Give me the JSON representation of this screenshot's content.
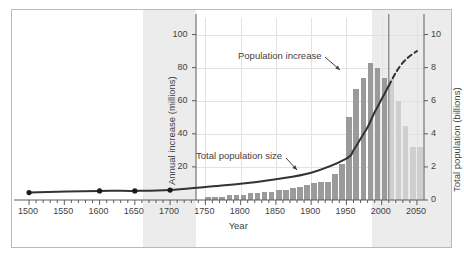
{
  "figure": {
    "background": "#ffffff",
    "frame_color": "#b9b9b9",
    "shade_color": "#ececec",
    "bar_color_historic": "#9a9a9a",
    "bar_color_projected": "#cfcfcf",
    "line_color": "#333333",
    "present_line_color": "#8d8d8d"
  },
  "axes": {
    "x": {
      "label": "Year",
      "ticks": [
        1500,
        1550,
        1600,
        1650,
        1700,
        1750,
        1800,
        1850,
        1900,
        1950,
        2000,
        2050
      ],
      "tick_labels": [
        "1500",
        "1550",
        "1600",
        "1650",
        "1700",
        "1750",
        "1800",
        "1850",
        "1900",
        "1950",
        "2000",
        "2050"
      ],
      "minor_tick_step": 10,
      "range": [
        1490,
        2060
      ]
    },
    "y_left": {
      "label": "Annual increase (millions)",
      "ticks": [
        20,
        40,
        60,
        80,
        100
      ],
      "tick_labels": [
        "20",
        "40",
        "60",
        "80",
        "100"
      ],
      "range": [
        0,
        110
      ]
    },
    "y_right": {
      "label": "Total population (billions)",
      "ticks": [
        0,
        2,
        4,
        6,
        8,
        10
      ],
      "tick_labels": [
        "0",
        "2",
        "4",
        "6",
        "8",
        "10"
      ],
      "range": [
        0,
        11
      ]
    }
  },
  "annotations": [
    {
      "name": "population-increase",
      "text": "Population increase"
    },
    {
      "name": "total-population-size",
      "text": "Total population size"
    }
  ],
  "chart_data": {
    "type": "bar",
    "title": "",
    "xlabel": "Year",
    "ylabel": "Annual increase (millions)",
    "ylabel_secondary": "Total population (billions)",
    "xlim": [
      1490,
      2060
    ],
    "ylim": [
      0,
      110
    ],
    "ylim_secondary": [
      0,
      11
    ],
    "grid": true,
    "legend": "none",
    "present_year": 2010,
    "series": [
      {
        "name": "Population increase",
        "type": "bar",
        "axis": "left",
        "units": "millions per year",
        "bar_interval_years": 10,
        "x": [
          1750,
          1760,
          1770,
          1780,
          1790,
          1800,
          1810,
          1820,
          1830,
          1840,
          1850,
          1860,
          1870,
          1880,
          1890,
          1900,
          1910,
          1920,
          1930,
          1940,
          1950,
          1960,
          1970,
          1980,
          1990,
          2000,
          2010,
          2020,
          2030,
          2040,
          2050
        ],
        "values": [
          2,
          2,
          2,
          3,
          3,
          3,
          4,
          4,
          5,
          5,
          6,
          6,
          7,
          8,
          9,
          10,
          11,
          11,
          16,
          22,
          50,
          67,
          74,
          83,
          80,
          74,
          73,
          60,
          45,
          32,
          32
        ],
        "projected_from": 2010
      },
      {
        "name": "Total population size",
        "type": "line",
        "axis": "right",
        "units": "billions",
        "x": [
          1500,
          1600,
          1650,
          1700,
          1750,
          1800,
          1850,
          1900,
          1950,
          1960,
          1970,
          1980,
          1990,
          2000,
          2010,
          2020,
          2030,
          2040,
          2050
        ],
        "values": [
          0.45,
          0.55,
          0.55,
          0.6,
          0.79,
          0.98,
          1.26,
          1.65,
          2.5,
          3.0,
          3.7,
          4.4,
          5.3,
          6.1,
          6.9,
          7.7,
          8.3,
          8.7,
          9.0
        ],
        "dashed_from": 2010,
        "marker_points": [
          {
            "x": 1500,
            "y": 0.45
          },
          {
            "x": 1600,
            "y": 0.55
          },
          {
            "x": 1650,
            "y": 0.55
          },
          {
            "x": 1700,
            "y": 0.6
          }
        ]
      }
    ]
  }
}
